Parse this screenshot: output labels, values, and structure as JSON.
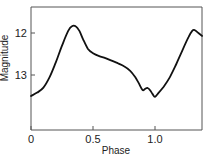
{
  "chart_data": {
    "type": "line",
    "title": "",
    "xlabel": "Phase",
    "ylabel": "Magnitude",
    "xlim": [
      0,
      1.38
    ],
    "ylim": [
      14.3,
      11.45
    ],
    "y_inverted": true,
    "grid": false,
    "legend": null,
    "x_ticks": [
      {
        "value": 0,
        "label": "0"
      },
      {
        "value": 0.5,
        "label": "0.5"
      },
      {
        "value": 1.0,
        "label": "1.0"
      }
    ],
    "y_ticks": [
      {
        "value": 12,
        "label": "12"
      },
      {
        "value": 13,
        "label": "13"
      }
    ],
    "series": [
      {
        "name": "light curve",
        "color": "#111111",
        "x": [
          0.0,
          0.05,
          0.1,
          0.15,
          0.2,
          0.25,
          0.3,
          0.33,
          0.36,
          0.39,
          0.42,
          0.46,
          0.5,
          0.55,
          0.6,
          0.65,
          0.7,
          0.75,
          0.8,
          0.84,
          0.87,
          0.9,
          0.92,
          0.94,
          0.96,
          0.98,
          1.0,
          1.03,
          1.07,
          1.12,
          1.17,
          1.22,
          1.27,
          1.3,
          1.32,
          1.35,
          1.38
        ],
        "values": [
          13.5,
          13.42,
          13.3,
          13.05,
          12.7,
          12.3,
          11.95,
          11.84,
          11.84,
          11.95,
          12.15,
          12.38,
          12.48,
          12.55,
          12.6,
          12.66,
          12.72,
          12.79,
          12.9,
          13.05,
          13.2,
          13.36,
          13.33,
          13.31,
          13.36,
          13.45,
          13.52,
          13.42,
          13.28,
          13.05,
          12.75,
          12.42,
          12.1,
          11.95,
          11.93,
          12.0,
          12.07
        ]
      }
    ]
  },
  "plot": {
    "left_px": 31,
    "right_px": 202,
    "top_px": 7,
    "bottom_px": 130
  }
}
